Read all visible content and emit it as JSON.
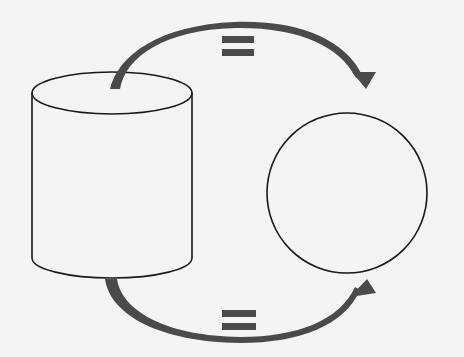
{
  "diagram": {
    "nodes": [
      {
        "id": "cylinder",
        "shape": "cylinder",
        "label": ""
      },
      {
        "id": "circle",
        "shape": "circle",
        "label": ""
      }
    ],
    "edges": [
      {
        "from": "cylinder",
        "to": "circle",
        "position": "top",
        "label": "="
      },
      {
        "from": "cylinder",
        "to": "circle",
        "position": "bottom",
        "label": "="
      }
    ],
    "colors": {
      "background": "#f4f4f2",
      "outline": "#1a1a1a",
      "arrow": "#4a4a4a",
      "equals": "#4a4a4a"
    }
  }
}
